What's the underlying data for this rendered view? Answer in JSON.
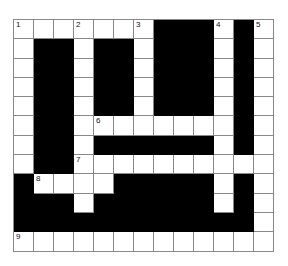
{
  "puzzle": {
    "type": "crossword",
    "cols": 13,
    "rows": 12,
    "layout": [
      "#######BBB#B#",
      "#BB#BB#BBB#B#",
      "#BB#BB#BBB#B#",
      "#BB#BB#BBB#B#",
      "#BB#BB#BBB#B#",
      "#BB#######B#",
      "#BB#BBBBBB#B#",
      "#BB##########",
      "B####BBBBB#B#",
      "BBB#BBBBBB#B#",
      "BBBBBBBBBBBB#",
      "#############"
    ],
    "numbers": [
      {
        "n": "1",
        "row": 0,
        "col": 0
      },
      {
        "n": "2",
        "row": 0,
        "col": 3
      },
      {
        "n": "3",
        "row": 0,
        "col": 6
      },
      {
        "n": "4",
        "row": 0,
        "col": 10
      },
      {
        "n": "5",
        "row": 0,
        "col": 12
      },
      {
        "n": "6",
        "row": 5,
        "col": 4
      },
      {
        "n": "7",
        "row": 7,
        "col": 3
      },
      {
        "n": "8",
        "row": 8,
        "col": 1
      },
      {
        "n": "9",
        "row": 11,
        "col": 0
      }
    ],
    "colors": {
      "block": "#000000",
      "cell": "#ffffff",
      "line": "#888888"
    }
  }
}
